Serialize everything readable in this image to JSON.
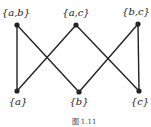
{
  "diagram": {
    "type": "hasse",
    "nodes": [
      {
        "id": "ab",
        "label": "{a,b}",
        "x": 17,
        "y": 25,
        "lx": 16,
        "ly": 8
      },
      {
        "id": "ac",
        "label": "{a,c}",
        "x": 76,
        "y": 25,
        "lx": 76,
        "ly": 8
      },
      {
        "id": "bc",
        "label": "{b,c}",
        "x": 138,
        "y": 24,
        "lx": 136,
        "ly": 7
      },
      {
        "id": "a",
        "label": "{a}",
        "x": 17,
        "y": 91,
        "lx": 18,
        "ly": 97
      },
      {
        "id": "b",
        "label": "{b}",
        "x": 79,
        "y": 92,
        "lx": 79,
        "ly": 97
      },
      {
        "id": "c",
        "label": "{c}",
        "x": 139,
        "y": 91,
        "lx": 140,
        "ly": 97
      }
    ],
    "edges": [
      [
        "ab",
        "a"
      ],
      [
        "ab",
        "b"
      ],
      [
        "ac",
        "a"
      ],
      [
        "ac",
        "c"
      ],
      [
        "bc",
        "b"
      ],
      [
        "bc",
        "c"
      ]
    ],
    "line_color": "#222222",
    "caption": "图 1.11"
  }
}
